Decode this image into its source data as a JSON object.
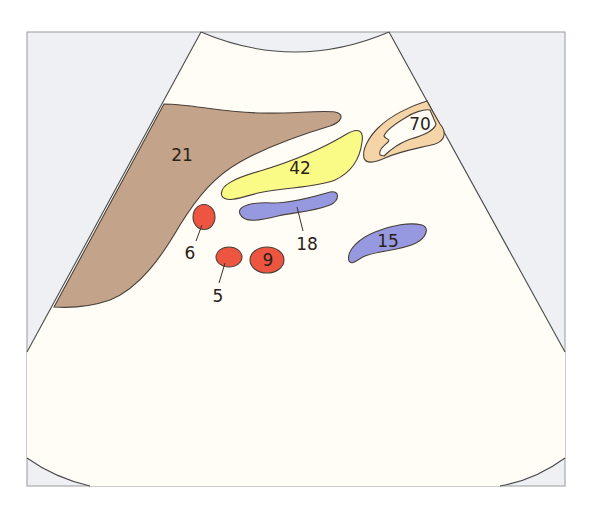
{
  "diagram": {
    "type": "ultrasound-sector-schematic",
    "colors": {
      "frame_background": "#eef0f3",
      "frame_border": "#9a9a9a",
      "sector_fill": "#fffdf6",
      "sector_outline": "#4a4a4a",
      "structure_21": "#c4a38b",
      "structure_42": "#fafa86",
      "structure_70_outer": "#f5d5a8",
      "structure_70_inner": "#fffdf6",
      "structure_18": "#9699e0",
      "structure_15": "#9699e0",
      "structure_6": "#ee5540",
      "structure_5": "#ee5540",
      "structure_9": "#ee5540"
    },
    "labels": {
      "s21": "21",
      "s42": "42",
      "s70": "70",
      "s18": "18",
      "s15": "15",
      "s6": "6",
      "s5": "5",
      "s9": "9"
    }
  }
}
